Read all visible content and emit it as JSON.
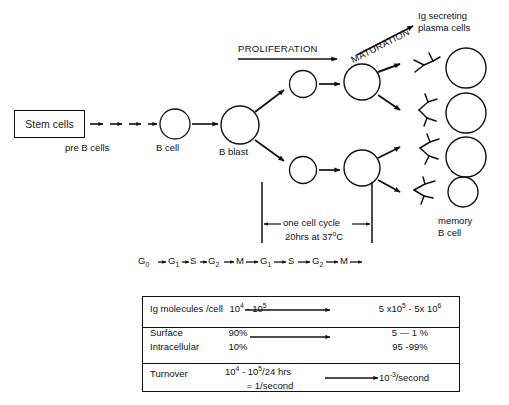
{
  "stages": {
    "stem_cells": "Stem cells",
    "pre_b_cells": "pre B cells",
    "b_cell": "B cell",
    "b_blast": "B blast",
    "proliferation": "PROLIFERATION",
    "maturation": "MATURATION",
    "plasma_cells_line1": "Ig secreting",
    "plasma_cells_line2": "plasma cells",
    "memory_line1": "memory",
    "memory_line2": "B cell"
  },
  "cell_cycle": {
    "bracket_label": "one cell cycle",
    "duration": "20hrs at 37",
    "duration_sup": "o",
    "duration_unit": "C",
    "phases": [
      {
        "base": "G",
        "sub": "0"
      },
      {
        "base": "G",
        "sub": "1"
      },
      {
        "base": "S",
        "sub": ""
      },
      {
        "base": "G",
        "sub": "2"
      },
      {
        "base": "M",
        "sub": ""
      },
      {
        "base": "G",
        "sub": "1"
      },
      {
        "base": "S",
        "sub": ""
      },
      {
        "base": "G",
        "sub": "2"
      },
      {
        "base": "M",
        "sub": ""
      }
    ]
  },
  "table": {
    "rows": [
      {
        "label": "Ig molecules /cell",
        "before_html": "10<sup class=\"sup\">4</sup> - 10<sup class=\"sup\">5</sup>",
        "after_html": "5 x10<sup class=\"sup\">5</sup> - 5x 10<sup class=\"sup\">6</sup>",
        "arrow": true
      },
      {
        "label": "Surface",
        "label2": "Intracellular",
        "before_html": "90%",
        "before2_html": "10%",
        "after_html": "5 — 1 %",
        "after2_html": "95 -99%",
        "arrow": true
      },
      {
        "label": "Turnover",
        "before_html": "10<sup class=\"sup\">4</sup> - 10<sup class=\"sup\">5</sup>/24 hrs",
        "before2_html": "= 1/second",
        "after_html": "10<sup class=\"sup\">-3</sup>/second",
        "arrow": true
      }
    ]
  },
  "colors": {
    "ink": "#111111",
    "background": "#ffffff"
  }
}
